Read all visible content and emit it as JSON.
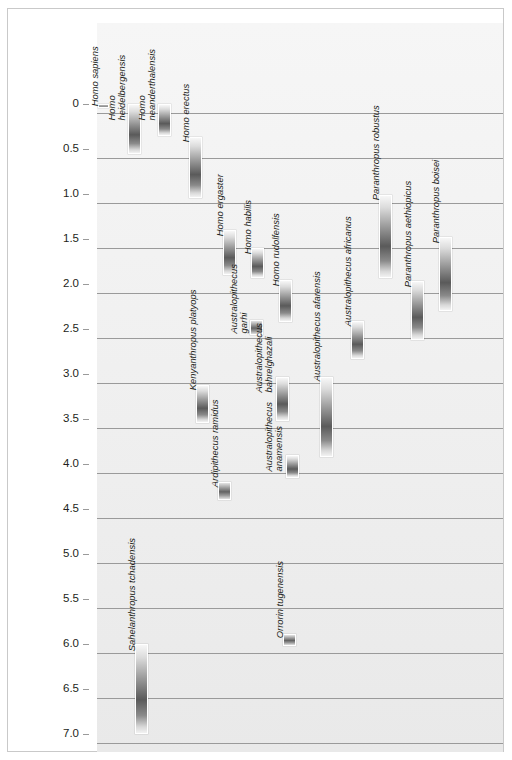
{
  "chart_data": {
    "type": "bar",
    "orientation": "vertical-ranges",
    "title": "",
    "xlabel": "",
    "ylabel": "MILLIONS OF YEARS BEFORE PRESENT",
    "ylim": [
      0,
      7.0
    ],
    "y_inverted": true,
    "grid": true,
    "legend": "none",
    "tick_labels": [
      "0",
      "0.5",
      "1.0",
      "1.5",
      "2.0",
      "2.5",
      "3.0",
      "3.5",
      "4.0",
      "4.5",
      "5.0",
      "5.5",
      "6.0",
      "6.5",
      "7.0"
    ],
    "tick_values": [
      0,
      0.5,
      1.0,
      1.5,
      2.0,
      2.5,
      3.0,
      3.5,
      4.0,
      4.5,
      5.0,
      5.5,
      6.0,
      6.5,
      7.0
    ],
    "unit": "millions of years before present",
    "series": [
      {
        "name": "Homo sapiens",
        "label_lines": [
          "Homo sapiens"
        ],
        "start": 0.0,
        "end": 0.04,
        "x": 98,
        "width": 11,
        "label_x": 100,
        "label_bottom": 96
      },
      {
        "name": "Homo heidelbergensis",
        "label_lines": [
          "Homo",
          "heidelbergensis"
        ],
        "start": 0.0,
        "end": 0.55,
        "x": 128,
        "width": 13,
        "label_x": 127,
        "label_bottom": 100
      },
      {
        "name": "Homo neanderthalensis",
        "label_lines": [
          "Homo",
          "neanderthalensis"
        ],
        "start": 0.0,
        "end": 0.35,
        "x": 158,
        "width": 13,
        "label_x": 157,
        "label_bottom": 100
      },
      {
        "name": "Homo erectus",
        "label_lines": [
          "Homo erectus"
        ],
        "start": 0.37,
        "end": 1.05,
        "x": 189,
        "width": 13,
        "label_x": 191,
        "label_bottom": 132
      },
      {
        "name": "Homo ergaster",
        "label_lines": [
          "Homo ergaster"
        ],
        "start": 1.4,
        "end": 1.9,
        "x": 223,
        "width": 13,
        "label_x": 225,
        "label_bottom": 226
      },
      {
        "name": "Australopithecus garhi",
        "label_lines": [
          "Australopithecus",
          "garhi"
        ],
        "start": 2.4,
        "end": 2.57,
        "x": 250,
        "width": 13,
        "label_x": 249,
        "label_bottom": 313
      },
      {
        "name": "Homo habilis",
        "label_lines": [
          "Homo habilis"
        ],
        "start": 1.6,
        "end": 1.93,
        "x": 251,
        "width": 13,
        "label_x": 253,
        "label_bottom": 244
      },
      {
        "name": "Homo rudolfensis",
        "label_lines": [
          "Homo rudolfensis"
        ],
        "start": 1.95,
        "end": 2.42,
        "x": 279,
        "width": 13,
        "label_x": 281,
        "label_bottom": 276
      },
      {
        "name": "Kenyanthropus platyops",
        "label_lines": [
          "Kenyanthropus platyops"
        ],
        "start": 3.12,
        "end": 3.55,
        "x": 196,
        "width": 13,
        "label_x": 198,
        "label_bottom": 380
      },
      {
        "name": "Ardipithecus ramidus",
        "label_lines": [
          "Ardipithecus ramidus"
        ],
        "start": 4.2,
        "end": 4.4,
        "x": 218,
        "width": 13,
        "label_x": 220,
        "label_bottom": 477
      },
      {
        "name": "Australopithecus bahrelghazali",
        "label_lines": [
          "Australopithecus",
          "bahrelghazali"
        ],
        "start": 3.03,
        "end": 3.52,
        "x": 276,
        "width": 13,
        "label_x": 274,
        "label_bottom": 372
      },
      {
        "name": "Australopithecus anamensis",
        "label_lines": [
          "Australopithecus",
          "anamensis"
        ],
        "start": 3.9,
        "end": 4.15,
        "x": 286,
        "width": 13,
        "label_x": 284,
        "label_bottom": 451
      },
      {
        "name": "Australopithecus afarensis",
        "label_lines": [
          "Australopithecus afarensis"
        ],
        "start": 3.03,
        "end": 3.92,
        "x": 320,
        "width": 13,
        "label_x": 322,
        "label_bottom": 371
      },
      {
        "name": "Australopithecus africanus",
        "label_lines": [
          "Australopithecus africanus"
        ],
        "start": 2.41,
        "end": 2.83,
        "x": 351,
        "width": 13,
        "label_x": 353,
        "label_bottom": 316
      },
      {
        "name": "Paranthropus robustus",
        "label_lines": [
          "Paranthropus robustus"
        ],
        "start": 1.01,
        "end": 1.93,
        "x": 379,
        "width": 13,
        "label_x": 381,
        "label_bottom": 190
      },
      {
        "name": "Paranthropus aethiopicus",
        "label_lines": [
          "Paranthropus aethiopicus"
        ],
        "start": 1.97,
        "end": 2.62,
        "x": 411,
        "width": 13,
        "label_x": 413,
        "label_bottom": 277
      },
      {
        "name": "Paranthropus boisei",
        "label_lines": [
          "Paranthropus boisei"
        ],
        "start": 1.48,
        "end": 2.3,
        "x": 439,
        "width": 13,
        "label_x": 441,
        "label_bottom": 233
      },
      {
        "name": "Sahelanthropus tchadensis",
        "label_lines": [
          "Sahelanthropus tchadensis"
        ],
        "start": 6.0,
        "end": 7.0,
        "x": 135,
        "width": 13,
        "label_x": 137,
        "label_bottom": 641
      },
      {
        "name": "Orrorin tugenensis",
        "label_lines": [
          "Orrorin tugenensis"
        ],
        "start": 5.89,
        "end": 6.02,
        "x": 283,
        "width": 13,
        "label_x": 285,
        "label_bottom": 628
      }
    ]
  }
}
